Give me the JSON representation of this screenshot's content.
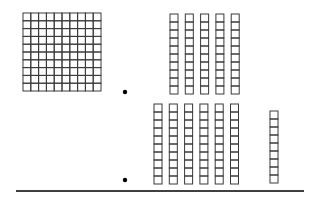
{
  "diagram": {
    "title": "",
    "colors": {
      "stroke": "#3a3a3a",
      "background": "#ffffff",
      "dot": "#000000",
      "line": "#000000"
    },
    "hundreds_flat": {
      "count": 1,
      "rows": 10,
      "cols": 10,
      "x": 23,
      "y": 13,
      "cell": 7.8
    },
    "top_row": {
      "rods": {
        "count": 5,
        "units_per_rod": 10,
        "x_start": 170,
        "y": 14,
        "step": 15.3,
        "cell_w": 8,
        "cell_h": 8
      }
    },
    "bottom_row": {
      "rods": {
        "count": 6,
        "units_per_rod": 10,
        "x_start": 154,
        "y": 104,
        "step": 15.3,
        "cell_w": 8,
        "cell_h": 8
      },
      "units_column": {
        "count": 9,
        "x": 270,
        "y": 111,
        "cell_w": 8,
        "cell_h": 8
      }
    },
    "dots": [
      {
        "x": 125,
        "y": 92
      },
      {
        "x": 125,
        "y": 180
      }
    ],
    "baseline": {
      "x1": 16,
      "x2": 304,
      "y": 191
    }
  }
}
